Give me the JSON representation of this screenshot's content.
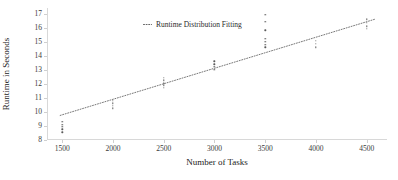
{
  "chart_data": {
    "type": "scatter",
    "title": "",
    "xlabel": "Number of Tasks",
    "ylabel": "Runtime in Seconds",
    "xlim": [
      1350,
      4700
    ],
    "ylim": [
      8,
      17.4
    ],
    "xticks": [
      "1500",
      "2000",
      "2500",
      "3000",
      "3500",
      "4000",
      "4500"
    ],
    "xtick_values": [
      1500,
      2000,
      2500,
      3000,
      3500,
      4000,
      4500
    ],
    "yticks": [
      "8",
      "9",
      "10",
      "11",
      "12",
      "13",
      "14",
      "15",
      "16",
      "17"
    ],
    "ytick_values": [
      8,
      9,
      10,
      11,
      12,
      13,
      14,
      15,
      16,
      17
    ],
    "grid": false,
    "legend_position": "upper-left-inside",
    "legend": [
      {
        "label": "Runtime Distribution Fitting",
        "marker": "dotted-line",
        "color": "#555555"
      }
    ],
    "series": [
      {
        "name": "Runtime samples",
        "type": "scatter",
        "marker": "point",
        "color": "#5a5a5a",
        "points": [
          {
            "x": 1500,
            "y": 8.55
          },
          {
            "x": 1500,
            "y": 8.75
          },
          {
            "x": 1500,
            "y": 8.95
          },
          {
            "x": 1500,
            "y": 9.1
          },
          {
            "x": 1500,
            "y": 9.3
          },
          {
            "x": 2000,
            "y": 10.25
          },
          {
            "x": 2000,
            "y": 10.45
          },
          {
            "x": 2000,
            "y": 10.6
          },
          {
            "x": 2000,
            "y": 10.8
          },
          {
            "x": 2500,
            "y": 11.7
          },
          {
            "x": 2500,
            "y": 11.9
          },
          {
            "x": 2500,
            "y": 12.05
          },
          {
            "x": 2500,
            "y": 12.25
          },
          {
            "x": 2500,
            "y": 12.45
          },
          {
            "x": 3000,
            "y": 13.0
          },
          {
            "x": 3000,
            "y": 13.2
          },
          {
            "x": 3000,
            "y": 13.4
          },
          {
            "x": 3000,
            "y": 13.6
          },
          {
            "x": 3500,
            "y": 14.6
          },
          {
            "x": 3500,
            "y": 14.8
          },
          {
            "x": 3500,
            "y": 15.0
          },
          {
            "x": 3500,
            "y": 15.2
          },
          {
            "x": 3500,
            "y": 15.8
          },
          {
            "x": 3500,
            "y": 16.4
          },
          {
            "x": 3500,
            "y": 16.9
          },
          {
            "x": 4000,
            "y": 14.6
          },
          {
            "x": 4000,
            "y": 14.85
          },
          {
            "x": 4000,
            "y": 15.05
          },
          {
            "x": 4500,
            "y": 15.9
          },
          {
            "x": 4500,
            "y": 16.1
          },
          {
            "x": 4500,
            "y": 16.35
          },
          {
            "x": 4500,
            "y": 16.6
          }
        ]
      },
      {
        "name": "Runtime Distribution Fitting",
        "type": "line",
        "linestyle": "dotted",
        "color": "#555555",
        "endpoints": [
          {
            "x": 1480,
            "y": 9.75
          },
          {
            "x": 4580,
            "y": 16.6
          }
        ]
      }
    ]
  }
}
